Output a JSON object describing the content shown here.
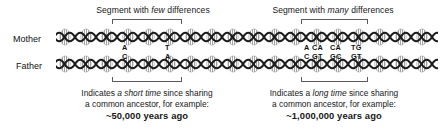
{
  "figure": {
    "background_color": "#ffffff",
    "ink_color": "#181818",
    "bracket_color": "#5b5b5b"
  },
  "rows": [
    {
      "label": "Mother"
    },
    {
      "label": "Father"
    }
  ],
  "segments": [
    {
      "id": "few",
      "heading_pre": "Segment with ",
      "heading_em": "few",
      "heading_post": " differences",
      "mother_bases": [
        "A",
        "T"
      ],
      "father_bases": [
        "C",
        "A"
      ],
      "caption_line1_pre": "Indicates ",
      "caption_line1_em": "a short time",
      "caption_line1_post": " since sharing",
      "caption_line2": "a common ancestor, for example:",
      "caption_years": "~50,000 years ago"
    },
    {
      "id": "many",
      "heading_pre": "Segment with ",
      "heading_em": "many",
      "heading_post": " differences",
      "mother_bases": [
        "A",
        "CA",
        "CA",
        "TG"
      ],
      "father_bases": [
        "C",
        "GT",
        "GC",
        "GT"
      ],
      "mother_row_text": "A  CA   CA   TG",
      "father_row_text": "C  GT   GC   GT",
      "caption_line1_pre": "Indicates a ",
      "caption_line1_em": "long time",
      "caption_line1_post": " since sharing",
      "caption_line2": "a common ancestor, for example:",
      "caption_years": "~1,000,000 years ago"
    }
  ]
}
